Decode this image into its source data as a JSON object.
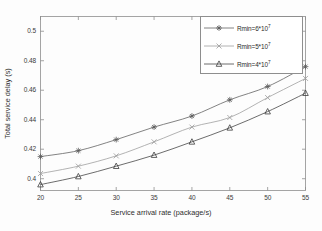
{
  "chart_data": {
    "type": "line",
    "title": "",
    "xlabel": "Service arrival rate (package/s)",
    "ylabel": "Total service delay (s)",
    "x": [
      20,
      25,
      30,
      35,
      40,
      45,
      50,
      55
    ],
    "xlim": [
      20,
      55
    ],
    "ylim": [
      0.392,
      0.51
    ],
    "xticks": [
      "20",
      "25",
      "30",
      "35",
      "40",
      "45",
      "50",
      "55"
    ],
    "yticks": [
      "0.4",
      "0.42",
      "0.44",
      "0.46",
      "0.48",
      "0.5"
    ],
    "ytick_values": [
      0.4,
      0.42,
      0.44,
      0.46,
      0.48,
      0.5
    ],
    "grid": false,
    "legend_position": "top-right",
    "series": [
      {
        "name": "Rmin=6*10",
        "exponent": "7",
        "marker": "star",
        "color": "#5a5a5a",
        "values": [
          0.415,
          0.419,
          0.4265,
          0.435,
          0.4425,
          0.4535,
          0.4625,
          0.476
        ]
      },
      {
        "name": "Rmin=5*10",
        "exponent": "7",
        "marker": "cross",
        "color": "#9a9a9a",
        "values": [
          0.4035,
          0.4085,
          0.4155,
          0.425,
          0.435,
          0.4415,
          0.455,
          0.468
        ]
      },
      {
        "name": "Rmin=4*10",
        "exponent": "7",
        "marker": "triangle",
        "color": "#3c3c3c",
        "values": [
          0.396,
          0.4015,
          0.4085,
          0.416,
          0.425,
          0.4345,
          0.4455,
          0.458
        ]
      }
    ]
  },
  "axes": {
    "frame_color": "#8e8e8e"
  }
}
